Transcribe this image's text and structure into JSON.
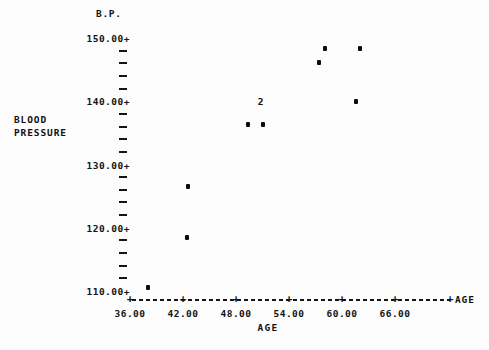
{
  "chart_data": {
    "type": "scatter",
    "title": "",
    "xlabel": "AGE",
    "ylabel": "BLOOD PRESSURE",
    "y_axis_header": "B.P.",
    "x_axis_end_label": "AGE",
    "xlim": [
      36,
      68
    ],
    "ylim": [
      108.5,
      151
    ],
    "grid": false,
    "legend": null,
    "x_ticks": [
      "36.00",
      "42.00",
      "48.00",
      "54.00",
      "60.00",
      "66.00"
    ],
    "x_tick_values": [
      36,
      42,
      48,
      54,
      60,
      66
    ],
    "x_tick_glyph": "+",
    "y_ticks": [
      "150.00+",
      "140.00+",
      "130.00+",
      "120.00+",
      "110.00+"
    ],
    "y_tick_values": [
      150,
      140,
      130,
      120,
      110
    ],
    "y_minor_per_interval": 4,
    "points": [
      {
        "x": 38.0,
        "y": 110.5,
        "marker": "dot",
        "count": 1
      },
      {
        "x": 42.5,
        "y": 118.4,
        "marker": "dot",
        "count": 1
      },
      {
        "x": 42.6,
        "y": 126.6,
        "marker": "dot",
        "count": 1
      },
      {
        "x": 49.4,
        "y": 136.3,
        "marker": "dot",
        "count": 1
      },
      {
        "x": 51.0,
        "y": 136.3,
        "marker": "dot",
        "count": 1
      },
      {
        "x": 50.8,
        "y": 140.0,
        "marker": "2",
        "count": 2
      },
      {
        "x": 57.4,
        "y": 146.2,
        "marker": "dot",
        "count": 1
      },
      {
        "x": 58.1,
        "y": 148.3,
        "marker": "dot",
        "count": 1
      },
      {
        "x": 61.6,
        "y": 140.0,
        "marker": "dot",
        "count": 1
      },
      {
        "x": 62.0,
        "y": 148.3,
        "marker": "dot",
        "count": 1
      }
    ]
  },
  "axes": {
    "y_header": "B.P.",
    "y_name_line1": "BLOOD",
    "y_name_line2": "PRESSURE",
    "x_name_bottom": "AGE",
    "x_name_end": "AGE"
  },
  "colors": {
    "ink": "#111111",
    "marker": "#0d0d0d",
    "background": "#fdfdfd"
  }
}
